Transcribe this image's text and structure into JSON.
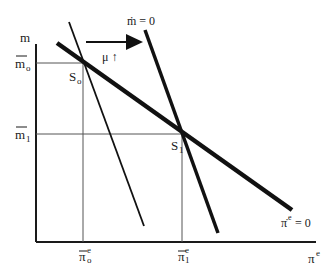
{
  "diagram": {
    "axes": {
      "y_label": "m",
      "x_label": "π",
      "x_label_sup": "e"
    },
    "y_ticks": [
      {
        "base": "m",
        "sub": "o",
        "overbar": true
      },
      {
        "base": "m",
        "sub": "1",
        "overbar": true
      }
    ],
    "x_ticks": [
      {
        "base": "π",
        "sub": "o",
        "sup": "e",
        "overbar": true
      },
      {
        "base": "π",
        "sub": "1",
        "sup": "e",
        "overbar": true
      }
    ],
    "points": [
      {
        "base": "S",
        "sub": "o"
      },
      {
        "base": "S",
        "sub": "1"
      }
    ],
    "curves": {
      "m_dot": {
        "label": "ṁ = 0"
      },
      "pi_dot": {
        "base": "π̇",
        "sup": "e",
        "rest": " = 0"
      }
    },
    "shift": {
      "label": "μ ↑"
    }
  }
}
